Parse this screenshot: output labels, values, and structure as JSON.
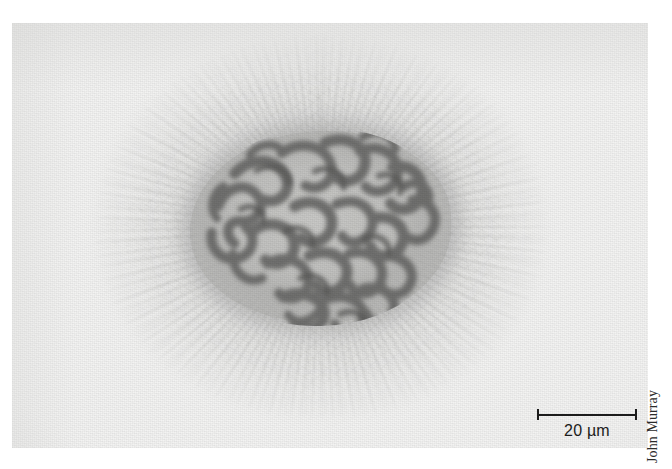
{
  "figure": {
    "kind": "light-micrograph",
    "background_color": "#ffffff",
    "plate_color": "#f3f3f2",
    "chromatin_color": "#6e6e6c",
    "nucleoplasm_color": "#d6d6d4",
    "cytoplasm_color": "#9c9c9a",
    "ink_color": "#1c1c1c"
  },
  "scale_bar": {
    "label": "20 µm",
    "value": 20,
    "unit": "µm",
    "length_px": 100
  },
  "credit": {
    "text": "John Murray",
    "orientation": "vertical-bottom-to-top"
  },
  "ghost_text": {
    "text": " "
  }
}
